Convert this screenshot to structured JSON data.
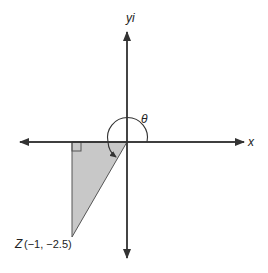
{
  "diagram": {
    "axes": {
      "x_label": "x",
      "y_label": "yi"
    },
    "angle_label": "θ",
    "point": {
      "name": "Z",
      "coords": "(−1, −2.5)"
    },
    "colors": {
      "axis": "#333333",
      "triangle_fill": "#c8c8c8",
      "triangle_stroke": "#555555"
    }
  }
}
